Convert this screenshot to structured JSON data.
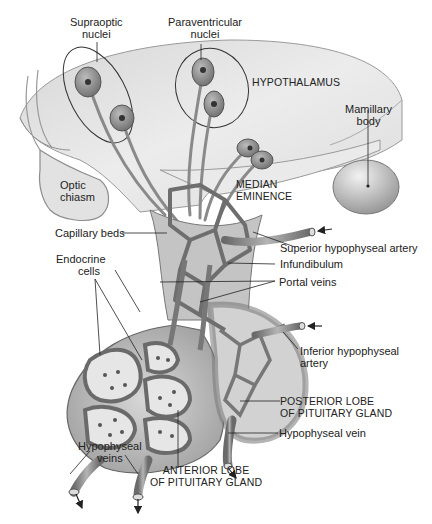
{
  "diagram": {
    "colors": {
      "background": "#ffffff",
      "hypothalamus": "#e4e4e4",
      "tissue_dark": "#8a8a8a",
      "vessel": "#7a7a7a",
      "vessel_light": "#a8a8a8",
      "neuron": "#9a9a9a",
      "label_text": "#222222",
      "leader_line": "#222222"
    },
    "labels": {
      "supraoptic_1": "Supraoptic",
      "supraoptic_2": "nuclei",
      "paraventricular_1": "Paraventricular",
      "paraventricular_2": "nuclei",
      "hypothalamus": "HYPOTHALAMUS",
      "mamillary_1": "Mamillary",
      "mamillary_2": "body",
      "optic_1": "Optic",
      "optic_2": "chiasm",
      "median_1": "MEDIAN",
      "median_2": "EMINENCE",
      "capillary_beds": "Capillary beds",
      "superior_artery": "Superior hypophyseal artery",
      "endocrine_1": "Endocrine",
      "endocrine_2": "cells",
      "infundibulum": "Infundibulum",
      "portal_veins": "Portal veins",
      "inferior_artery_1": "Inferior hypophyseal",
      "inferior_artery_2": "artery",
      "posterior_1": "POSTERIOR LOBE",
      "posterior_2": "OF PITUITARY GLAND",
      "hypophyseal_vein": "Hypophyseal vein",
      "hypophyseal_veins_1": "Hypophyseal",
      "hypophyseal_veins_2": "veins",
      "anterior_1": "ANTERIOR LOBE",
      "anterior_2": "OF PITUITARY GLAND"
    }
  }
}
